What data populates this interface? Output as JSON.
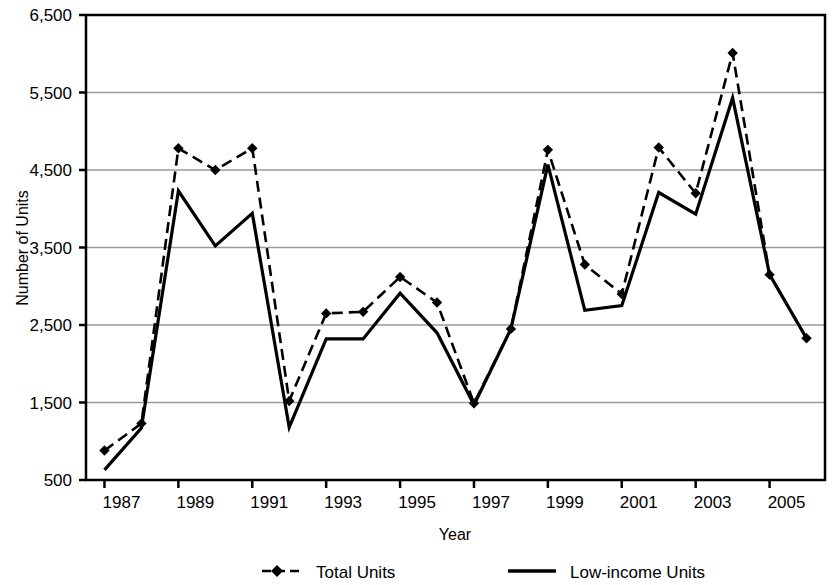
{
  "chart_data": {
    "type": "line",
    "title": "",
    "xlabel": "Year",
    "ylabel": "Number of Units",
    "x": [
      1987,
      1988,
      1989,
      1990,
      1991,
      1992,
      1993,
      1994,
      1995,
      1996,
      1997,
      1998,
      1999,
      2000,
      2001,
      2002,
      2003,
      2004,
      2005,
      2006
    ],
    "xlim": [
      1986.5,
      2006.5
    ],
    "ylim": [
      500,
      6500
    ],
    "yticks": [
      500,
      1500,
      2500,
      3500,
      4500,
      5500,
      6500
    ],
    "ytick_labels": [
      "500",
      "1,500",
      "2,500",
      "3,500",
      "4,500",
      "5,500",
      "6,500"
    ],
    "xticks": [
      1987,
      1989,
      1991,
      1993,
      1995,
      1997,
      1999,
      2001,
      2003,
      2005
    ],
    "xtick_labels": [
      "1987",
      "1989",
      "1991",
      "1993",
      "1995",
      "1997",
      "1999",
      "2001",
      "2003",
      "2005"
    ],
    "grid": "horizontal",
    "legend_position": "bottom",
    "series": [
      {
        "name": "Total Units",
        "style": "dashed",
        "marker": "diamond",
        "values": [
          880,
          1230,
          4780,
          4500,
          4780,
          1520,
          2650,
          2670,
          3120,
          2790,
          1490,
          2450,
          4760,
          3280,
          2900,
          4790,
          4200,
          6010,
          3150,
          2330
        ]
      },
      {
        "name": "Low-income Units",
        "style": "solid",
        "marker": "none",
        "values": [
          630,
          1170,
          4230,
          3520,
          3940,
          1180,
          2320,
          2320,
          2910,
          2400,
          1470,
          2450,
          4570,
          2690,
          2750,
          4210,
          3930,
          5430,
          3150,
          2330
        ]
      }
    ]
  },
  "legend": {
    "items": [
      {
        "label": "Total Units"
      },
      {
        "label": "Low-income Units"
      }
    ]
  },
  "axes": {
    "y_title": "Number of Units",
    "x_title": "Year"
  }
}
